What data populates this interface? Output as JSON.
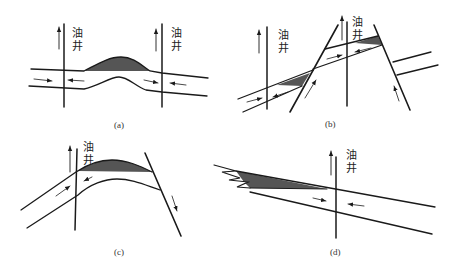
{
  "figure": {
    "panels": [
      {
        "id": "a",
        "caption": "(a)",
        "well_labels": [
          "油井",
          "油井"
        ],
        "description": "Anticline trap: oil accumulates at crest between two wells"
      },
      {
        "id": "b",
        "caption": "(b)",
        "well_labels": [
          "油井"
        ],
        "description": "Fault-block traps: oil trapped against faults"
      },
      {
        "id": "c",
        "caption": "(c)",
        "well_labels": [
          "油井"
        ],
        "description": "Faulted anticline trap"
      },
      {
        "id": "d",
        "caption": "(d)",
        "well_labels": [
          "油井"
        ],
        "description": "Stratigraphic pinch-out trap"
      }
    ],
    "well_label_chars": {
      "top": "油",
      "bottom": "井"
    },
    "colors": {
      "oil": "#555555",
      "line": "#1a1a1a",
      "background": "#ffffff"
    }
  }
}
